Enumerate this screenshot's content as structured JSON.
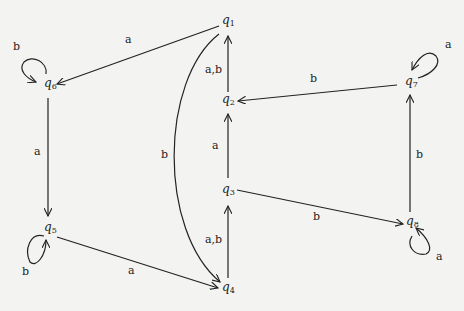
{
  "diagram": {
    "type": "state-automaton",
    "states": [
      {
        "id": "q1",
        "name": "q",
        "sub": "1",
        "x": 226,
        "y": 22
      },
      {
        "id": "q2",
        "name": "q",
        "sub": "2",
        "x": 226,
        "y": 100
      },
      {
        "id": "q3",
        "name": "q",
        "sub": "3",
        "x": 226,
        "y": 190
      },
      {
        "id": "q4",
        "name": "q",
        "sub": "4",
        "x": 226,
        "y": 288
      },
      {
        "id": "q5",
        "name": "q",
        "sub": "5",
        "x": 48,
        "y": 228
      },
      {
        "id": "q6",
        "name": "q",
        "sub": "6",
        "x": 48,
        "y": 84
      },
      {
        "id": "q7",
        "name": "q",
        "sub": "7",
        "x": 410,
        "y": 82
      },
      {
        "id": "q8",
        "name": "q",
        "sub": "8",
        "x": 410,
        "y": 222
      }
    ],
    "transitions": [
      {
        "from": "q1",
        "to": "q6",
        "label": "a"
      },
      {
        "from": "q6",
        "to": "q6",
        "label": "b"
      },
      {
        "from": "q6",
        "to": "q5",
        "label": "a"
      },
      {
        "from": "q5",
        "to": "q5",
        "label": "b"
      },
      {
        "from": "q5",
        "to": "q4",
        "label": "a"
      },
      {
        "from": "q1",
        "to": "q4",
        "label": "b"
      },
      {
        "from": "q4",
        "to": "q3",
        "label": "a,b"
      },
      {
        "from": "q3",
        "to": "q2",
        "label": "a"
      },
      {
        "from": "q2",
        "to": "q1",
        "label": "a,b"
      },
      {
        "from": "q7",
        "to": "q2",
        "label": "b"
      },
      {
        "from": "q7",
        "to": "q7",
        "label": "a"
      },
      {
        "from": "q8",
        "to": "q7",
        "label": "b"
      },
      {
        "from": "q3",
        "to": "q8",
        "label": "b"
      },
      {
        "from": "q8",
        "to": "q8",
        "label": "a"
      }
    ]
  }
}
